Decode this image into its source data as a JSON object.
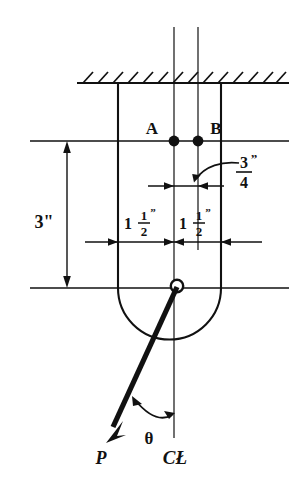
{
  "figure": {
    "type": "engineering-mechanical-drawing",
    "background_color": "#ffffff",
    "line_color": "#111111",
    "canvas": {
      "width": 291,
      "height": 487
    }
  },
  "labels": {
    "point_a": "A",
    "point_b": "B",
    "force": "P",
    "angle": "θ",
    "centerline": "CŁ"
  },
  "dimensions": [
    {
      "name": "vertical-height",
      "text": "3\"",
      "value": 3,
      "unit": "in",
      "whole": "3",
      "numerator": "",
      "denominator": "",
      "orientation": "vertical",
      "position": "left"
    },
    {
      "name": "horizontal-left-spacing",
      "text": "1 1/2\"",
      "value": 1.5,
      "unit": "in",
      "whole": "1",
      "numerator": "1",
      "denominator": "2",
      "orientation": "horizontal",
      "position": "lower-left"
    },
    {
      "name": "horizontal-right-spacing",
      "text": "1 1/2\"",
      "value": 1.5,
      "unit": "in",
      "whole": "1",
      "numerator": "1",
      "denominator": "2",
      "orientation": "horizontal",
      "position": "lower-right"
    },
    {
      "name": "bolt-offset",
      "text": "3/4\"",
      "value": 0.75,
      "unit": "in",
      "whole": "",
      "numerator": "3",
      "denominator": "4",
      "orientation": "horizontal",
      "position": "upper-right"
    }
  ],
  "elements": {
    "ground_hatch": {
      "name": "fixed-support-hatching",
      "count": 14
    },
    "bolt_a": {
      "name": "bolt-point-a",
      "filled": true
    },
    "bolt_b": {
      "name": "bolt-point-b",
      "filled": true
    },
    "pin": {
      "name": "load-application-pin",
      "filled": false
    },
    "force_arrow": {
      "name": "force-vector-p",
      "style": "thick-solid-arrow"
    },
    "angle_arc": {
      "name": "angle-theta-arc",
      "style": "double-headed-arc"
    },
    "leader_arc": {
      "name": "leader-arc-three-quarter",
      "style": "curved-leader"
    }
  }
}
